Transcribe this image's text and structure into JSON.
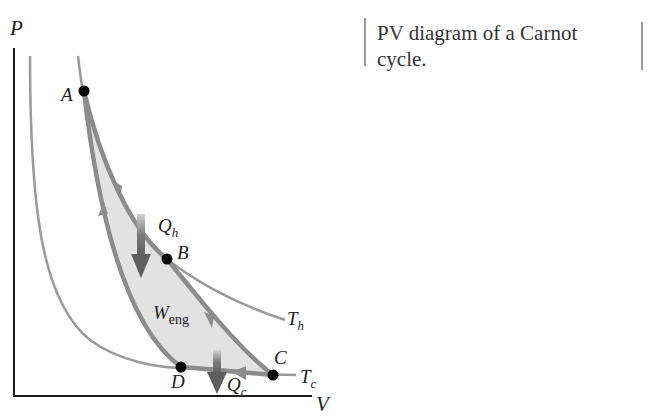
{
  "caption": {
    "prefix": "PV",
    "text": " diagram of a Carnot cycle."
  },
  "axes": {
    "x_label": "V",
    "y_label": "P"
  },
  "points": [
    {
      "label": "A",
      "x": 84,
      "y": 91
    },
    {
      "label": "B",
      "x": 167,
      "y": 259
    },
    {
      "label": "C",
      "x": 273,
      "y": 375
    },
    {
      "label": "D",
      "x": 181,
      "y": 367
    }
  ],
  "isotherms": [
    {
      "label": "T",
      "sub": "h"
    },
    {
      "label": "T",
      "sub": "c"
    }
  ],
  "heat": {
    "hot": {
      "label": "Q",
      "sub": "h"
    },
    "cold": {
      "label": "Q",
      "sub": "c"
    }
  },
  "work": {
    "label": "W",
    "sub": "eng"
  },
  "colors": {
    "curve": "#9a9a9a",
    "cycle_path": "#8c8c8c",
    "fill": "#e2e2e2",
    "arrow": "#6e6e6e",
    "axis": "#1a1a1a",
    "point": "#000000"
  }
}
